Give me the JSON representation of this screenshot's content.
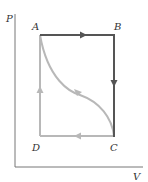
{
  "diagram": {
    "type": "PV cycle",
    "axes": {
      "y_label": "P",
      "x_label": "V"
    },
    "points": [
      {
        "id": "A",
        "label": "A",
        "x": 40,
        "y": 35
      },
      {
        "id": "B",
        "label": "B",
        "x": 114,
        "y": 35
      },
      {
        "id": "C",
        "label": "C",
        "x": 114,
        "y": 136
      },
      {
        "id": "D",
        "label": "D",
        "x": 40,
        "y": 136
      }
    ],
    "paths": [
      {
        "from": "A",
        "to": "B",
        "style": "dark",
        "arrow": "right"
      },
      {
        "from": "B",
        "to": "C",
        "style": "dark",
        "arrow": "down"
      },
      {
        "from": "C",
        "to": "D",
        "style": "light",
        "arrow": "left"
      },
      {
        "from": "D",
        "to": "A",
        "style": "light",
        "arrow": "up"
      },
      {
        "from": "A",
        "to": "C",
        "style": "light",
        "shape": "curve",
        "arrow": "toward-C"
      }
    ],
    "colors": {
      "dark": "#555555",
      "light": "#b8b8b8",
      "axis": "#777777"
    }
  }
}
